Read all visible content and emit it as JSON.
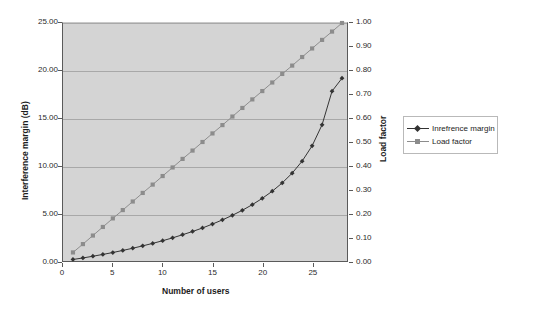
{
  "chart_data": {
    "type": "line",
    "title": "",
    "xlabel": "Number of users",
    "ylabel": "Interference margin (dB)",
    "y2label": "Load factor",
    "xlim": [
      0,
      28.5
    ],
    "ylim": [
      0,
      25
    ],
    "y2lim": [
      0,
      1.0
    ],
    "grid": true,
    "legend_position": "right",
    "xticks": [
      "0",
      "5",
      "10",
      "15",
      "20",
      "25"
    ],
    "xtick_values": [
      0,
      5,
      10,
      15,
      20,
      25
    ],
    "yticks": [
      "0.00",
      "5.00",
      "10.00",
      "15.00",
      "20.00",
      "25.00"
    ],
    "ytick_values": [
      0,
      5,
      10,
      15,
      20,
      25
    ],
    "y2ticks": [
      "0.00",
      "0.10",
      "0.20",
      "0.30",
      "0.40",
      "0.50",
      "0.60",
      "0.70",
      "0.80",
      "0.90",
      "1.00"
    ],
    "y2tick_values": [
      0,
      0.1,
      0.2,
      0.3,
      0.4,
      0.5,
      0.6,
      0.7,
      0.8,
      0.9,
      1.0
    ],
    "x": [
      1,
      2,
      3,
      4,
      5,
      6,
      7,
      8,
      9,
      10,
      11,
      12,
      13,
      14,
      15,
      16,
      17,
      18,
      19,
      20,
      21,
      22,
      23,
      24,
      25,
      26,
      27,
      28
    ],
    "series": [
      {
        "name": "Inrefrence margin",
        "axis": "left",
        "color": "#333333",
        "marker": "diamond",
        "values": [
          0.16,
          0.32,
          0.5,
          0.69,
          0.89,
          1.11,
          1.34,
          1.59,
          1.85,
          2.13,
          2.43,
          2.76,
          3.1,
          3.47,
          3.88,
          4.32,
          4.8,
          5.33,
          5.92,
          6.58,
          7.33,
          8.2,
          9.23,
          10.49,
          12.1,
          14.31,
          17.84,
          19.2
        ]
      },
      {
        "name": "Load factor",
        "axis": "right",
        "color": "#8c8c8c",
        "marker": "square",
        "values": [
          0.036,
          0.071,
          0.107,
          0.143,
          0.179,
          0.214,
          0.25,
          0.286,
          0.321,
          0.357,
          0.393,
          0.429,
          0.464,
          0.5,
          0.536,
          0.571,
          0.607,
          0.643,
          0.679,
          0.714,
          0.75,
          0.786,
          0.821,
          0.857,
          0.893,
          0.929,
          0.964,
          1.0
        ]
      }
    ]
  },
  "legend": {
    "items": [
      {
        "label": "Inrefrence margin",
        "marker": "diamond-marker-icon"
      },
      {
        "label": "Load factor",
        "marker": "square-marker-icon"
      }
    ]
  },
  "colors": {
    "plot_background": "#d4d4d4",
    "gridline": "#a8a8a8",
    "axis": "#5a5a5a",
    "series_primary": "#333333",
    "series_secondary": "#8c8c8c",
    "page_background": "#ffffff"
  }
}
